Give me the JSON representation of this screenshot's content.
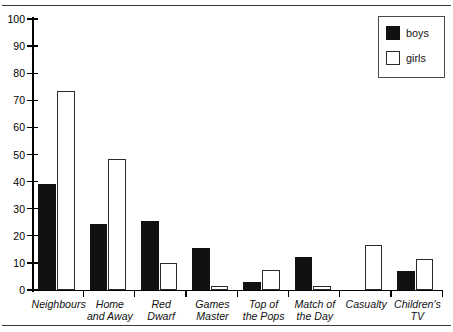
{
  "chart_data": {
    "type": "bar",
    "title": "",
    "xlabel": "",
    "ylabel": "",
    "ylim": [
      0,
      100
    ],
    "yticks": [
      0,
      10,
      20,
      30,
      40,
      50,
      60,
      70,
      80,
      90,
      100
    ],
    "grid": false,
    "legend_position": "top-right",
    "categories": [
      "Neighbours",
      "Home\nand Away",
      "Red\nDwarf",
      "Games\nMaster",
      "Top of\nthe Pops",
      "Match of\nthe Day",
      "Casualty",
      "Children's\nTV"
    ],
    "series": [
      {
        "name": "boys",
        "color": "#111111",
        "values": [
          39,
          24.5,
          25.5,
          15.5,
          3,
          12,
          0,
          7
        ]
      },
      {
        "name": "girls",
        "color": "#ffffff",
        "values": [
          73.5,
          48.5,
          10,
          1.5,
          7.5,
          1.5,
          16.5,
          11.5
        ]
      }
    ]
  },
  "legend": {
    "entries": [
      {
        "label": "boys",
        "swatch": "filled-black-square"
      },
      {
        "label": "girls",
        "swatch": "outlined-white-square"
      }
    ]
  },
  "colors": {
    "boys_fill": "#111111",
    "girls_fill": "#ffffff",
    "outline": "#2b2b2b",
    "axis": "#000000",
    "rule": "#3a3a3a"
  }
}
